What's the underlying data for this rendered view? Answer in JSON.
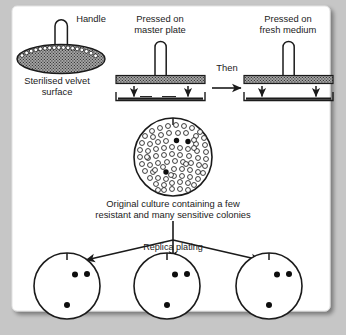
{
  "figure": {
    "type": "replica-plating-diagram",
    "background_color": "#c6c6c6",
    "panel_color": "#ffffff",
    "ink_color": "#1b1b1b",
    "velvet_fill": "#9c9c9c"
  },
  "labels": {
    "handle": "Handle",
    "velvet_line1": "Sterilised velvet",
    "velvet_line2": "surface",
    "master_line1": "Pressed on",
    "master_line2": "master plate",
    "then": "Then",
    "fresh_line1": "Pressed on",
    "fresh_line2": "fresh medium",
    "culture_line1": "Original culture containing a few",
    "culture_line2": "resistant and many sensitive colonies",
    "replica_plating": "Replica plating"
  },
  "master_plate": {
    "arrow_count": 2,
    "tool": "velvet-stamp"
  },
  "fresh_plate": {
    "arrow_count": 2,
    "tool": "velvet-stamp"
  },
  "culture_plate": {
    "sensitive_colony_count": 82,
    "resistant_colony_count": 3,
    "resistant_colonies": [
      {
        "x": 176.5,
        "y": 140.5
      },
      {
        "x": 188.0,
        "y": 141.5
      },
      {
        "x": 166.0,
        "y": 172.0
      }
    ],
    "sensitive_colonies": [
      {
        "x": 160,
        "y": 128
      },
      {
        "x": 168,
        "y": 126
      },
      {
        "x": 176,
        "y": 125
      },
      {
        "x": 184,
        "y": 126
      },
      {
        "x": 192,
        "y": 128
      },
      {
        "x": 152,
        "y": 131
      },
      {
        "x": 200,
        "y": 132
      },
      {
        "x": 145,
        "y": 136
      },
      {
        "x": 153,
        "y": 137
      },
      {
        "x": 161,
        "y": 135
      },
      {
        "x": 169,
        "y": 133
      },
      {
        "x": 196,
        "y": 136
      },
      {
        "x": 204,
        "y": 138
      },
      {
        "x": 142,
        "y": 143
      },
      {
        "x": 150,
        "y": 144
      },
      {
        "x": 158,
        "y": 142
      },
      {
        "x": 166,
        "y": 141
      },
      {
        "x": 196,
        "y": 144
      },
      {
        "x": 205,
        "y": 145
      },
      {
        "x": 140,
        "y": 150
      },
      {
        "x": 148,
        "y": 151
      },
      {
        "x": 156,
        "y": 149
      },
      {
        "x": 164,
        "y": 148
      },
      {
        "x": 172,
        "y": 147
      },
      {
        "x": 180,
        "y": 148
      },
      {
        "x": 188,
        "y": 149
      },
      {
        "x": 197,
        "y": 151
      },
      {
        "x": 206,
        "y": 152
      },
      {
        "x": 140,
        "y": 157
      },
      {
        "x": 148,
        "y": 158
      },
      {
        "x": 156,
        "y": 156
      },
      {
        "x": 164,
        "y": 155
      },
      {
        "x": 172,
        "y": 154
      },
      {
        "x": 180,
        "y": 155
      },
      {
        "x": 189,
        "y": 156
      },
      {
        "x": 198,
        "y": 158
      },
      {
        "x": 206,
        "y": 159
      },
      {
        "x": 142,
        "y": 164
      },
      {
        "x": 150,
        "y": 165
      },
      {
        "x": 158,
        "y": 163
      },
      {
        "x": 167,
        "y": 162
      },
      {
        "x": 175,
        "y": 161
      },
      {
        "x": 183,
        "y": 162
      },
      {
        "x": 191,
        "y": 163
      },
      {
        "x": 199,
        "y": 165
      },
      {
        "x": 205,
        "y": 166
      },
      {
        "x": 145,
        "y": 171
      },
      {
        "x": 153,
        "y": 172
      },
      {
        "x": 174,
        "y": 169
      },
      {
        "x": 182,
        "y": 169
      },
      {
        "x": 190,
        "y": 170
      },
      {
        "x": 198,
        "y": 172
      },
      {
        "x": 203,
        "y": 173
      },
      {
        "x": 150,
        "y": 178
      },
      {
        "x": 158,
        "y": 178
      },
      {
        "x": 166,
        "y": 179
      },
      {
        "x": 174,
        "y": 176
      },
      {
        "x": 182,
        "y": 176
      },
      {
        "x": 190,
        "y": 177
      },
      {
        "x": 198,
        "y": 179
      },
      {
        "x": 156,
        "y": 184
      },
      {
        "x": 164,
        "y": 185
      },
      {
        "x": 172,
        "y": 183
      },
      {
        "x": 180,
        "y": 182
      },
      {
        "x": 188,
        "y": 183
      },
      {
        "x": 194,
        "y": 185
      },
      {
        "x": 164,
        "y": 190
      },
      {
        "x": 172,
        "y": 189
      },
      {
        "x": 180,
        "y": 189
      },
      {
        "x": 188,
        "y": 190
      },
      {
        "x": 147,
        "y": 157
      },
      {
        "x": 155,
        "y": 170
      },
      {
        "x": 163,
        "y": 167
      },
      {
        "x": 171,
        "y": 175
      },
      {
        "x": 186,
        "y": 164
      },
      {
        "x": 194,
        "y": 148
      },
      {
        "x": 178,
        "y": 133
      },
      {
        "x": 186,
        "y": 133
      },
      {
        "x": 194,
        "y": 140
      },
      {
        "x": 158,
        "y": 190
      }
    ]
  },
  "replica_plates": [
    {
      "id": "plate-1",
      "colonies": [
        {
          "x": 75.0,
          "y": 274.5
        },
        {
          "x": 87.0,
          "y": 274.0
        },
        {
          "x": 67.0,
          "y": 305.0
        }
      ]
    },
    {
      "id": "plate-2",
      "colonies": [
        {
          "x": 175.0,
          "y": 274.5
        },
        {
          "x": 187.0,
          "y": 274.0
        },
        {
          "x": 167.0,
          "y": 305.0
        }
      ]
    },
    {
      "id": "plate-3",
      "colonies": [
        {
          "x": 277.0,
          "y": 274.5
        },
        {
          "x": 289.0,
          "y": 274.0
        },
        {
          "x": 269.0,
          "y": 305.0
        }
      ]
    }
  ]
}
